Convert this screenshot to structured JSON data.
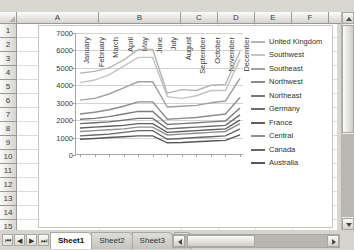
{
  "grid": {
    "columns": [
      "A",
      "B",
      "C",
      "D",
      "E",
      "F"
    ],
    "rows": [
      "1",
      "2",
      "3",
      "4",
      "5",
      "6",
      "7",
      "8",
      "9",
      "10",
      "11",
      "12",
      "13",
      "14",
      "15",
      "16"
    ]
  },
  "sheet_tabs": {
    "tabs": [
      "Sheet1",
      "Sheet2",
      "Sheet3"
    ],
    "active": "Sheet1",
    "new_sheet_label": "❐",
    "nav_first": "⏮",
    "nav_prev": "◀",
    "nav_next": "▶",
    "nav_last": "⏭"
  },
  "chart_data": {
    "type": "line",
    "title": "",
    "xlabel": "",
    "ylabel": "",
    "ylim": [
      0,
      7000
    ],
    "yticks": [
      0,
      1000,
      2000,
      3000,
      4000,
      5000,
      6000,
      7000
    ],
    "grid": true,
    "legend_position": "right",
    "categories": [
      "January",
      "February",
      "March",
      "April",
      "May",
      "June",
      "July",
      "August",
      "September",
      "October",
      "November",
      "December"
    ],
    "series": [
      {
        "name": "United Kingdom",
        "color": "#b4b4b4",
        "values": [
          4700,
          4800,
          5000,
          5450,
          6050,
          6050,
          3550,
          3750,
          3700,
          4000,
          4050,
          5950
        ]
      },
      {
        "name": "Southwest",
        "color": "#c3c3c3",
        "values": [
          4150,
          4300,
          4600,
          5100,
          5600,
          5600,
          3350,
          3250,
          3400,
          3700,
          3700,
          5500
        ]
      },
      {
        "name": "Southeast",
        "color": "#a0a0a0",
        "values": [
          3150,
          3250,
          3500,
          3850,
          4200,
          4200,
          2750,
          2800,
          2850,
          3000,
          3100,
          4400
        ]
      },
      {
        "name": "Northwest",
        "color": "#8c8c8c",
        "values": [
          2350,
          2450,
          2600,
          2800,
          3050,
          3050,
          2050,
          2100,
          2150,
          2250,
          2350,
          3300
        ]
      },
      {
        "name": "Northeast",
        "color": "#7a7a7a",
        "values": [
          2050,
          2100,
          2200,
          2350,
          2500,
          2500,
          1750,
          1800,
          1850,
          1900,
          1950,
          2700
        ]
      },
      {
        "name": "Germany",
        "color": "#6d6d6d",
        "values": [
          1800,
          1850,
          1900,
          2000,
          2100,
          2100,
          1500,
          1550,
          1600,
          1650,
          1700,
          2300
        ]
      },
      {
        "name": "France",
        "color": "#5f5f5f",
        "values": [
          1550,
          1600,
          1650,
          1700,
          1800,
          1800,
          1300,
          1350,
          1400,
          1450,
          1500,
          2000
        ]
      },
      {
        "name": "Central",
        "color": "#8f8f8f",
        "values": [
          1350,
          1400,
          1450,
          1500,
          1600,
          1600,
          1150,
          1200,
          1250,
          1300,
          1350,
          1800
        ]
      },
      {
        "name": "Canada",
        "color": "#666666",
        "values": [
          1100,
          1150,
          1200,
          1300,
          1400,
          1400,
          900,
          950,
          1000,
          1050,
          1100,
          1500
        ]
      },
      {
        "name": "Australia",
        "color": "#575757",
        "values": [
          900,
          950,
          1000,
          1050,
          1100,
          1100,
          700,
          720,
          760,
          800,
          840,
          1150
        ]
      }
    ]
  }
}
